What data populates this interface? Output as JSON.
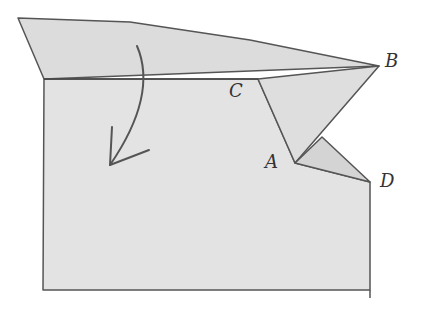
{
  "diagram": {
    "type": "paper-folding-diagram",
    "labels": {
      "A": "A",
      "B": "B",
      "C": "C",
      "D": "D"
    },
    "points": {
      "A": [
        295,
        163
      ],
      "B": [
        379,
        66
      ],
      "C": [
        258,
        79
      ],
      "D": [
        370,
        182
      ]
    },
    "colors": {
      "paper": "#e2e2e2",
      "paper_flap": "#dadada",
      "stroke": "#555555",
      "background": "#ffffff"
    },
    "arrow": {
      "direction": "fold-down",
      "description": "curved arrow indicating top flap folds down"
    }
  }
}
